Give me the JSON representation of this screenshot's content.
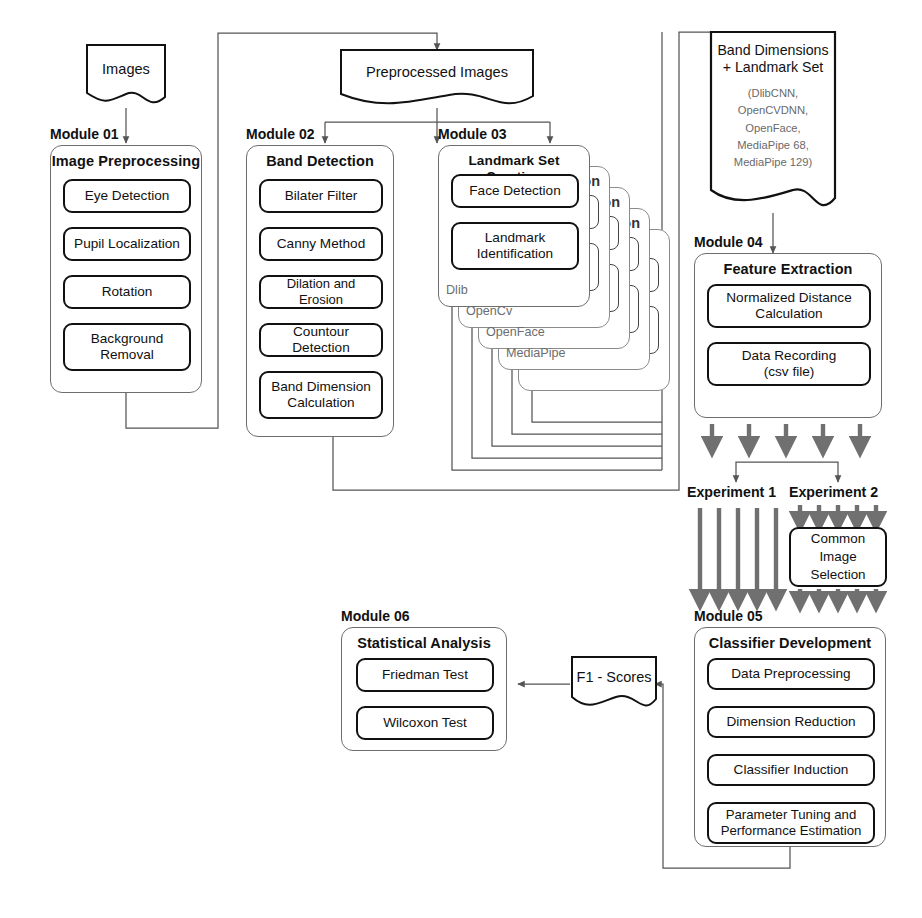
{
  "diagram": {
    "colors": {
      "line": "#555555",
      "box_border": "#111111",
      "module_border": "#6e6e6e",
      "thick_arrow": "#707070",
      "ghost": "#8b8b8b",
      "subtext": "#6a6a6a"
    }
  },
  "inputs": {
    "images_doc": "Images",
    "preprocessed_doc": "Preprocessed Images"
  },
  "modules": [
    {
      "label": "Module 01",
      "title": "Image Preprocessing",
      "steps": [
        "Eye Detection",
        "Pupil Localization",
        "Rotation",
        "Background\nRemoval"
      ]
    },
    {
      "label": "Module 02",
      "title": "Band Detection",
      "steps": [
        "Bilater Filter",
        "Canny Method",
        "Dilation and Erosion",
        "Countour Detection",
        "Band Dimension\nCalculation"
      ]
    },
    {
      "label": "Module 03",
      "title": "Landmark Set Creation",
      "steps": [
        "Face Detection",
        "Landmark\nIdentification"
      ],
      "stack_labels": [
        "Dlib",
        "OpenCv",
        "OpenFace",
        "MediaPipe"
      ]
    },
    {
      "label": "Module 04",
      "title": "Feature Extraction",
      "steps": [
        "Normalized Distance\nCalculation",
        "Data Recording\n(csv file)"
      ]
    },
    {
      "label": "Module 05",
      "title": "Classifier Development",
      "steps": [
        "Data Preprocessing",
        "Dimension Reduction",
        "Classifier Induction",
        "Parameter Tuning and\nPerformance Estimation"
      ]
    },
    {
      "label": "Module 06",
      "title": "Statistical Analysis",
      "steps": [
        "Friedman Test",
        "Wilcoxon Test"
      ]
    }
  ],
  "artifacts": {
    "band_dimensions_title": "Band Dimensions\n+ Landmark Set",
    "band_dimensions_sub": "(DlibCNN,\nOpenCVDNN,\nOpenFace,\nMediaPipe 68,\nMediaPipe 129)",
    "f1_scores": "F1 - Scores"
  },
  "experiments": {
    "exp1_label": "Experiment 1",
    "exp2_label": "Experiment 2",
    "common_image_selection": "Common\nImage\nSelection",
    "exp1_branch_count": 5,
    "exp2_branch_count": 5,
    "feature_output_count": 5
  }
}
